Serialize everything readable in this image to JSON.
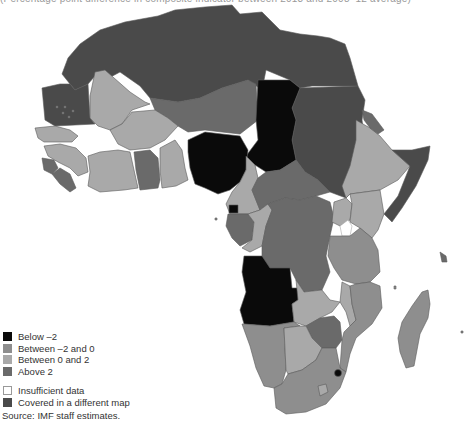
{
  "title": "(Percentage point difference in composite indicator between 2013 and 2008–12 average)",
  "colors": {
    "below_neg2": "#0a0a0a",
    "between_neg2_0": "#8e8e8e",
    "between_0_2": "#a9a9a9",
    "above_2": "#6a6a6a",
    "insufficient": "#ffffff",
    "different_map": "#4a4a4a",
    "border": "#5a5a5a"
  },
  "legend": {
    "items": [
      {
        "label": "Below –2",
        "key": "below_neg2"
      },
      {
        "label": "Between –2 and 0",
        "key": "between_neg2_0"
      },
      {
        "label": "Between 0 and 2",
        "key": "between_0_2"
      },
      {
        "label": "Above 2",
        "key": "above_2"
      },
      {
        "label": "Insufficient data",
        "key": "insufficient"
      },
      {
        "label": "Covered in a different map",
        "key": "different_map"
      }
    ]
  },
  "source": "Source: IMF staff estimates.",
  "regions": [
    {
      "name": "north-africa",
      "category": "different_map"
    },
    {
      "name": "mauritania",
      "category": "different_map"
    },
    {
      "name": "sudan",
      "category": "different_map"
    },
    {
      "name": "somalia",
      "category": "different_map"
    },
    {
      "name": "mali",
      "category": "between_0_2"
    },
    {
      "name": "niger",
      "category": "above_2"
    },
    {
      "name": "chad",
      "category": "below_neg2"
    },
    {
      "name": "nigeria",
      "category": "below_neg2"
    },
    {
      "name": "angola",
      "category": "below_neg2"
    },
    {
      "name": "equatorial-guinea",
      "category": "below_neg2"
    },
    {
      "name": "swaziland",
      "category": "below_neg2"
    },
    {
      "name": "senegal",
      "category": "between_0_2"
    },
    {
      "name": "guinea",
      "category": "between_0_2"
    },
    {
      "name": "burkina-faso",
      "category": "between_0_2"
    },
    {
      "name": "cote-divoire",
      "category": "between_0_2"
    },
    {
      "name": "ghana",
      "category": "above_2"
    },
    {
      "name": "sierra-leone",
      "category": "above_2"
    },
    {
      "name": "liberia",
      "category": "above_2"
    },
    {
      "name": "benin",
      "category": "between_0_2"
    },
    {
      "name": "cameroon",
      "category": "between_0_2"
    },
    {
      "name": "car",
      "category": "above_2"
    },
    {
      "name": "gabon",
      "category": "above_2"
    },
    {
      "name": "congo",
      "category": "between_0_2"
    },
    {
      "name": "drc",
      "category": "above_2"
    },
    {
      "name": "ethiopia",
      "category": "between_0_2"
    },
    {
      "name": "eritrea",
      "category": "above_2"
    },
    {
      "name": "uganda",
      "category": "between_neg2_0"
    },
    {
      "name": "kenya",
      "category": "between_0_2"
    },
    {
      "name": "tanzania",
      "category": "between_neg2_0"
    },
    {
      "name": "zambia",
      "category": "between_0_2"
    },
    {
      "name": "malawi",
      "category": "between_0_2"
    },
    {
      "name": "mozambique",
      "category": "between_neg2_0"
    },
    {
      "name": "zimbabwe",
      "category": "above_2"
    },
    {
      "name": "namibia",
      "category": "between_neg2_0"
    },
    {
      "name": "botswana",
      "category": "between_0_2"
    },
    {
      "name": "south-africa",
      "category": "between_neg2_0"
    },
    {
      "name": "madagascar",
      "category": "between_neg2_0"
    }
  ]
}
